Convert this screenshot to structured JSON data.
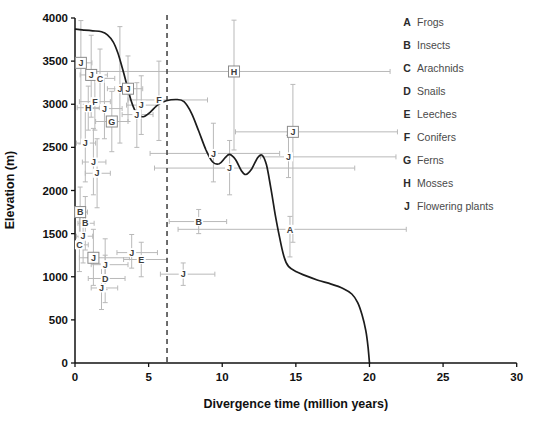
{
  "figure": {
    "background": "#ffffff",
    "axis_color": "#111111",
    "curve_color": "#1c1c1c",
    "errorbar_color": "#b9b9b9",
    "point_label_color": "#3c3c3c",
    "box_border_color": "#8c8c8c",
    "dashed_line_color": "#4a4a4a",
    "tick_label_color": "#111111"
  },
  "chart_data": {
    "type": "line",
    "title": "",
    "xlabel": "Divergence time (million years)",
    "ylabel": "Elevation (m)",
    "xlim": [
      0,
      30
    ],
    "ylim": [
      0,
      4000
    ],
    "xticks": [
      0,
      5,
      10,
      15,
      20,
      25,
      30
    ],
    "yticks": [
      0,
      500,
      1000,
      1500,
      2000,
      2500,
      3000,
      3500,
      4000
    ],
    "grid": false,
    "dashed_vline_x": 6.25,
    "curve_series_name": "Elevation profile vs divergence time",
    "curve": [
      [
        0.05,
        3870
      ],
      [
        0.6,
        3860
      ],
      [
        1.2,
        3852
      ],
      [
        1.8,
        3840
      ],
      [
        2.2,
        3805
      ],
      [
        2.6,
        3720
      ],
      [
        2.9,
        3600
      ],
      [
        3.2,
        3430
      ],
      [
        3.5,
        3240
      ],
      [
        3.8,
        3050
      ],
      [
        4.1,
        2920
      ],
      [
        4.4,
        2865
      ],
      [
        4.7,
        2858
      ],
      [
        5.1,
        2905
      ],
      [
        5.6,
        2990
      ],
      [
        6.2,
        3040
      ],
      [
        6.9,
        3055
      ],
      [
        7.4,
        3030
      ],
      [
        7.9,
        2900
      ],
      [
        8.4,
        2690
      ],
      [
        8.9,
        2470
      ],
      [
        9.35,
        2330
      ],
      [
        9.8,
        2310
      ],
      [
        10.2,
        2380
      ],
      [
        10.5,
        2420
      ],
      [
        10.9,
        2360
      ],
      [
        11.3,
        2230
      ],
      [
        11.6,
        2185
      ],
      [
        12.0,
        2250
      ],
      [
        12.4,
        2380
      ],
      [
        12.7,
        2410
      ],
      [
        13.0,
        2300
      ],
      [
        13.3,
        2030
      ],
      [
        13.6,
        1720
      ],
      [
        13.9,
        1450
      ],
      [
        14.2,
        1230
      ],
      [
        14.5,
        1120
      ],
      [
        15.0,
        1060
      ],
      [
        15.7,
        1010
      ],
      [
        16.5,
        960
      ],
      [
        17.4,
        915
      ],
      [
        18.2,
        865
      ],
      [
        18.8,
        800
      ],
      [
        19.2,
        700
      ],
      [
        19.5,
        555
      ],
      [
        19.75,
        375
      ],
      [
        19.9,
        190
      ],
      [
        20.0,
        0
      ]
    ],
    "points": [
      {
        "label": "J",
        "boxed": true,
        "x": 0.4,
        "y": 3480,
        "x_range": [
          0.05,
          1.15
        ],
        "y_range": [
          2540,
          3970
        ]
      },
      {
        "label": "J",
        "boxed": true,
        "x": 1.1,
        "y": 3340,
        "x_range": [
          0.35,
          2.2
        ],
        "y_range": [
          2850,
          3800
        ]
      },
      {
        "label": "C",
        "boxed": false,
        "x": 1.7,
        "y": 3300,
        "x_range": [
          0.9,
          2.7
        ],
        "y_range": [
          2950,
          3640
        ]
      },
      {
        "label": "J",
        "boxed": false,
        "x": 3.05,
        "y": 3180,
        "x_range": [
          2.2,
          3.9
        ],
        "y_range": [
          2550,
          3900
        ]
      },
      {
        "label": "J",
        "boxed": true,
        "x": 3.6,
        "y": 3180,
        "x_range": [
          2.7,
          4.6
        ],
        "y_range": [
          2800,
          3560
        ]
      },
      {
        "label": "H",
        "boxed": true,
        "x": 10.8,
        "y": 3380,
        "x_range": [
          1.4,
          21.4
        ],
        "y_range": [
          2470,
          3975
        ]
      },
      {
        "label": "F",
        "boxed": false,
        "x": 1.35,
        "y": 3030,
        "x_range": [
          0.3,
          2.4
        ],
        "y_range": [
          2700,
          3360
        ]
      },
      {
        "label": "H",
        "boxed": false,
        "x": 0.9,
        "y": 2960,
        "x_range": [
          0.15,
          1.65
        ],
        "y_range": [
          2700,
          3210
        ]
      },
      {
        "label": "J",
        "boxed": false,
        "x": 2.0,
        "y": 2950,
        "x_range": [
          1.0,
          3.2
        ],
        "y_range": [
          2600,
          3300
        ]
      },
      {
        "label": "G",
        "boxed": true,
        "x": 2.5,
        "y": 2800,
        "x_range": [
          1.4,
          3.6
        ],
        "y_range": [
          2450,
          3150
        ]
      },
      {
        "label": "J",
        "boxed": false,
        "x": 4.5,
        "y": 2990,
        "x_range": [
          3.5,
          5.5
        ],
        "y_range": [
          2650,
          3330
        ]
      },
      {
        "label": "J",
        "boxed": false,
        "x": 4.2,
        "y": 2880,
        "x_range": [
          3.2,
          5.3
        ],
        "y_range": [
          2500,
          3250
        ]
      },
      {
        "label": "F",
        "boxed": false,
        "x": 5.7,
        "y": 3050,
        "x_range": [
          3.6,
          9.0
        ],
        "y_range": [
          2580,
          3500
        ]
      },
      {
        "label": "J",
        "boxed": false,
        "x": 0.7,
        "y": 2550,
        "x_range": [
          0.1,
          1.4
        ],
        "y_range": [
          2100,
          3000
        ]
      },
      {
        "label": "J",
        "boxed": false,
        "x": 1.25,
        "y": 2330,
        "x_range": [
          0.5,
          2.1
        ],
        "y_range": [
          1950,
          2720
        ]
      },
      {
        "label": "J",
        "boxed": false,
        "x": 1.5,
        "y": 2200,
        "x_range": [
          0.7,
          2.4
        ],
        "y_range": [
          1800,
          2600
        ]
      },
      {
        "label": "J",
        "boxed": false,
        "x": 9.4,
        "y": 2430,
        "x_range": [
          5.1,
          13.9
        ],
        "y_range": [
          2100,
          2780
        ]
      },
      {
        "label": "J",
        "boxed": false,
        "x": 10.5,
        "y": 2260,
        "x_range": [
          5.4,
          19.0
        ],
        "y_range": [
          1950,
          2580
        ]
      },
      {
        "label": "J",
        "boxed": false,
        "x": 14.5,
        "y": 2390,
        "x_range": [
          12.6,
          21.8
        ],
        "y_range": [
          2150,
          2640
        ]
      },
      {
        "label": "J",
        "boxed": true,
        "x": 14.8,
        "y": 2680,
        "x_range": [
          10.9,
          21.9
        ],
        "y_range": [
          1400,
          3230
        ]
      },
      {
        "label": "B",
        "boxed": true,
        "x": 0.35,
        "y": 1750,
        "x_range": [
          0.05,
          0.85
        ],
        "y_range": [
          1460,
          2040
        ]
      },
      {
        "label": "B",
        "boxed": false,
        "x": 0.7,
        "y": 1620,
        "x_range": [
          0.2,
          1.3
        ],
        "y_range": [
          1310,
          1930
        ]
      },
      {
        "label": "J",
        "boxed": false,
        "x": 0.55,
        "y": 1470,
        "x_range": [
          0.1,
          1.2
        ],
        "y_range": [
          1160,
          1790
        ]
      },
      {
        "label": "C",
        "boxed": false,
        "x": 0.3,
        "y": 1370,
        "x_range": [
          0.05,
          0.9
        ],
        "y_range": [
          1060,
          1690
        ]
      },
      {
        "label": "B",
        "boxed": false,
        "x": 8.4,
        "y": 1640,
        "x_range": [
          6.4,
          10.3
        ],
        "y_range": [
          1500,
          1780
        ]
      },
      {
        "label": "A",
        "boxed": false,
        "x": 14.6,
        "y": 1550,
        "x_range": [
          7.0,
          22.5
        ],
        "y_range": [
          1230,
          1700
        ]
      },
      {
        "label": "J",
        "boxed": true,
        "x": 1.25,
        "y": 1220,
        "x_range": [
          0.3,
          3.7
        ],
        "y_range": [
          900,
          1550
        ]
      },
      {
        "label": "J",
        "boxed": false,
        "x": 3.85,
        "y": 1280,
        "x_range": [
          2.85,
          5.6
        ],
        "y_range": [
          1100,
          1490
        ]
      },
      {
        "label": "E",
        "boxed": false,
        "x": 4.5,
        "y": 1200,
        "x_range": [
          3.3,
          6.25
        ],
        "y_range": [
          1000,
          1400
        ]
      },
      {
        "label": "J",
        "boxed": false,
        "x": 2.05,
        "y": 1140,
        "x_range": [
          1.1,
          3.6
        ],
        "y_range": [
          850,
          1440
        ]
      },
      {
        "label": "D",
        "boxed": false,
        "x": 2.05,
        "y": 980,
        "x_range": [
          0.9,
          3.4
        ],
        "y_range": [
          700,
          1250
        ]
      },
      {
        "label": "J",
        "boxed": false,
        "x": 1.8,
        "y": 870,
        "x_range": [
          1.1,
          2.9
        ],
        "y_range": [
          620,
          1150
        ]
      },
      {
        "label": "J",
        "boxed": false,
        "x": 7.35,
        "y": 1030,
        "x_range": [
          5.8,
          9.5
        ],
        "y_range": [
          900,
          1160
        ]
      }
    ],
    "legend_position": "upper-right",
    "legend": [
      {
        "key": "A",
        "name": "Frogs"
      },
      {
        "key": "B",
        "name": "Insects"
      },
      {
        "key": "C",
        "name": "Arachnids"
      },
      {
        "key": "D",
        "name": "Snails"
      },
      {
        "key": "E",
        "name": "Leeches"
      },
      {
        "key": "F",
        "name": "Conifers"
      },
      {
        "key": "G",
        "name": "Ferns"
      },
      {
        "key": "H",
        "name": "Mosses"
      },
      {
        "key": "J",
        "name": "Flowering plants"
      }
    ]
  }
}
